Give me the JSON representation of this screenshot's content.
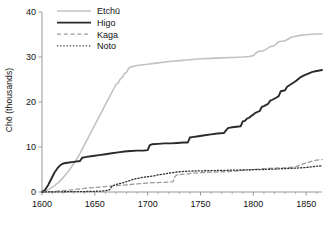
{
  "chart_data": {
    "type": "line",
    "title": "",
    "subtitle": "",
    "xlabel": "",
    "ylabel": "Chō (thousands)",
    "xlim": [
      1600,
      1865
    ],
    "ylim": [
      0,
      40
    ],
    "xticks": [
      1600,
      1650,
      1700,
      1750,
      1800,
      1850
    ],
    "xticklabels": [
      "1600",
      "1650",
      "1700",
      "1750",
      "1800",
      "1850"
    ],
    "yticks": [
      0,
      10,
      20,
      30,
      40
    ],
    "yticklabels": [
      "0",
      "10",
      "20",
      "30",
      "40"
    ],
    "xminorticks": [
      1610,
      1620,
      1630,
      1640,
      1660,
      1670,
      1680,
      1690,
      1710,
      1720,
      1730,
      1740,
      1760,
      1770,
      1780,
      1790,
      1810,
      1820,
      1830,
      1840,
      1860
    ],
    "grid": false,
    "legend_position": "top-left",
    "legend_entries": [
      "Etchū",
      "Higo",
      "Kaga",
      "Noto"
    ],
    "series": [
      {
        "name": "Etchū",
        "color": "#c2c2c2",
        "linestyle": "solid",
        "linewidth": 1.6,
        "x": [
          1600,
          1604,
          1608,
          1612,
          1616,
          1620,
          1624,
          1628,
          1632,
          1636,
          1640,
          1644,
          1648,
          1652,
          1656,
          1660,
          1664,
          1668,
          1670,
          1672,
          1674,
          1676,
          1678,
          1680,
          1682,
          1684,
          1686,
          1688,
          1690,
          1700,
          1710,
          1720,
          1730,
          1740,
          1750,
          1760,
          1770,
          1780,
          1790,
          1796,
          1800,
          1804,
          1810,
          1816,
          1820,
          1824,
          1830,
          1836,
          1840,
          1844,
          1848,
          1852,
          1856,
          1860,
          1865
        ],
        "y": [
          0.0,
          0.3,
          0.8,
          1.4,
          2.2,
          3.2,
          4.3,
          5.6,
          7.0,
          8.6,
          10.4,
          12.2,
          14.0,
          15.8,
          17.6,
          19.4,
          21.2,
          23.0,
          23.9,
          24.2,
          25.1,
          25.4,
          26.3,
          26.6,
          27.5,
          27.8,
          27.9,
          28.0,
          28.1,
          28.4,
          28.7,
          29.0,
          29.2,
          29.4,
          29.6,
          29.7,
          29.8,
          29.9,
          30.0,
          30.1,
          30.3,
          31.2,
          31.4,
          32.3,
          32.5,
          33.4,
          33.6,
          34.4,
          34.6,
          34.8,
          34.9,
          35.0,
          35.05,
          35.1,
          35.1
        ]
      },
      {
        "name": "Higo",
        "color": "#2b2b2b",
        "linestyle": "solid",
        "linewidth": 1.9,
        "x": [
          1600,
          1603,
          1606,
          1609,
          1612,
          1615,
          1618,
          1621,
          1624,
          1630,
          1636,
          1638,
          1640,
          1642,
          1648,
          1654,
          1660,
          1666,
          1672,
          1678,
          1684,
          1690,
          1696,
          1700,
          1702,
          1704,
          1710,
          1716,
          1722,
          1728,
          1734,
          1738,
          1740,
          1742,
          1748,
          1754,
          1760,
          1766,
          1772,
          1776,
          1778,
          1780,
          1784,
          1788,
          1790,
          1792,
          1794,
          1796,
          1798,
          1800,
          1802,
          1806,
          1808,
          1810,
          1814,
          1816,
          1818,
          1822,
          1824,
          1826,
          1830,
          1832,
          1836,
          1840,
          1844,
          1848,
          1852,
          1856,
          1860,
          1865
        ],
        "y": [
          0.0,
          0.5,
          1.6,
          3.0,
          4.4,
          5.4,
          6.1,
          6.4,
          6.5,
          6.7,
          6.9,
          7.6,
          7.7,
          7.8,
          8.0,
          8.2,
          8.4,
          8.6,
          8.8,
          9.0,
          9.1,
          9.2,
          9.2,
          9.3,
          10.4,
          10.6,
          10.7,
          10.8,
          10.8,
          10.9,
          11.0,
          11.0,
          12.1,
          12.2,
          12.4,
          12.6,
          12.8,
          13.0,
          13.1,
          14.2,
          14.3,
          14.4,
          14.5,
          14.6,
          15.7,
          15.8,
          16.3,
          16.5,
          16.9,
          17.2,
          17.6,
          18.0,
          18.9,
          19.1,
          19.6,
          20.3,
          20.5,
          21.0,
          21.3,
          22.4,
          22.6,
          23.4,
          24.0,
          24.6,
          25.4,
          25.9,
          26.3,
          26.7,
          26.9,
          27.1
        ]
      },
      {
        "name": "Kaga",
        "color": "#9a9a9a",
        "linestyle": "dashed",
        "linewidth": 1.3,
        "x": [
          1600,
          1610,
          1620,
          1630,
          1640,
          1650,
          1660,
          1670,
          1680,
          1690,
          1700,
          1710,
          1720,
          1724,
          1726,
          1728,
          1732,
          1740,
          1750,
          1760,
          1770,
          1780,
          1790,
          1800,
          1810,
          1820,
          1830,
          1836,
          1840,
          1844,
          1848,
          1852,
          1856,
          1860,
          1865
        ],
        "y": [
          0.0,
          0.1,
          0.3,
          0.5,
          0.8,
          1.0,
          1.2,
          1.4,
          1.6,
          1.8,
          2.0,
          2.1,
          2.2,
          2.3,
          3.5,
          3.8,
          3.9,
          4.1,
          4.3,
          4.4,
          4.5,
          4.6,
          4.8,
          5.0,
          5.2,
          5.3,
          5.4,
          5.5,
          5.6,
          6.0,
          6.3,
          6.6,
          6.9,
          7.1,
          7.2
        ]
      },
      {
        "name": "Noto",
        "color": "#303030",
        "linestyle": "dotted",
        "linewidth": 1.3,
        "x": [
          1600,
          1610,
          1620,
          1630,
          1640,
          1650,
          1656,
          1660,
          1664,
          1666,
          1668,
          1672,
          1676,
          1680,
          1684,
          1686,
          1690,
          1694,
          1700,
          1706,
          1710,
          1716,
          1720,
          1726,
          1730,
          1736,
          1740,
          1750,
          1760,
          1770,
          1780,
          1790,
          1800,
          1810,
          1820,
          1830,
          1840,
          1850,
          1856,
          1860,
          1865
        ],
        "y": [
          0.0,
          0.02,
          0.05,
          0.08,
          0.1,
          0.15,
          0.2,
          0.3,
          0.5,
          1.2,
          1.5,
          1.8,
          2.0,
          2.3,
          2.6,
          2.8,
          3.0,
          3.2,
          3.4,
          3.6,
          3.8,
          4.0,
          4.2,
          4.4,
          4.5,
          4.6,
          4.65,
          4.7,
          4.75,
          4.8,
          4.85,
          4.9,
          4.95,
          5.0,
          5.1,
          5.2,
          5.3,
          5.45,
          5.6,
          5.75,
          5.8
        ]
      }
    ]
  },
  "axes": {
    "spine_color": "#999999",
    "tick_color": "#999999",
    "text_color": "#111111"
  }
}
